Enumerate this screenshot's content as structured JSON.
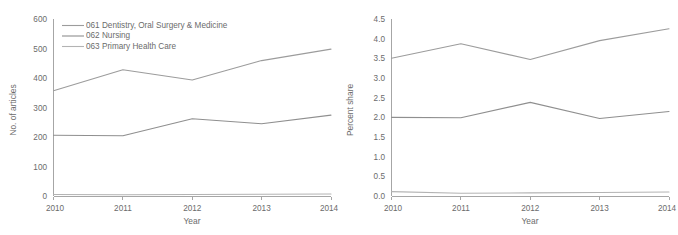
{
  "chart_data": [
    {
      "type": "line",
      "panel": "left",
      "title": "",
      "xlabel": "Year",
      "ylabel": "No. of articles",
      "x": [
        2010,
        2011,
        2012,
        2013,
        2014
      ],
      "categories": [
        "2010",
        "2011",
        "2012",
        "2013",
        "2014"
      ],
      "xticklabels": [
        "2010",
        "2011",
        "2012",
        "2013",
        "2014"
      ],
      "yticklabels": [
        "0",
        "100",
        "200",
        "300",
        "400",
        "500",
        "600"
      ],
      "yticks": [
        0,
        100,
        200,
        300,
        400,
        500,
        600
      ],
      "ylim": [
        0,
        600
      ],
      "grid": false,
      "legend_position": "top-left",
      "series": [
        {
          "name": "061 Dentistry, Oral Surgery & Medicine",
          "color": "#9c9c9c",
          "values": [
            357,
            428,
            393,
            459,
            498
          ]
        },
        {
          "name": "062 Nursing",
          "color": "#8f8f8f",
          "values": [
            206,
            204,
            262,
            245,
            274
          ]
        },
        {
          "name": "063 Primary Health Care",
          "color": "#b3b3b3",
          "values": [
            5,
            4,
            5,
            6,
            7
          ]
        }
      ]
    },
    {
      "type": "line",
      "panel": "right",
      "title": "",
      "xlabel": "Year",
      "ylabel": "Percent share",
      "x": [
        2010,
        2011,
        2012,
        2013,
        2014
      ],
      "categories": [
        "2010",
        "2011",
        "2012",
        "2013",
        "2014"
      ],
      "xticklabels": [
        "2010",
        "2011",
        "2012",
        "2013",
        "2014"
      ],
      "yticklabels": [
        "0.0",
        "0.5",
        "1.0",
        "1.5",
        "2.0",
        "2.5",
        "3.0",
        "3.5",
        "4.0",
        "4.5"
      ],
      "yticks": [
        0.0,
        0.5,
        1.0,
        1.5,
        2.0,
        2.5,
        3.0,
        3.5,
        4.0,
        4.5
      ],
      "ylim": [
        0.0,
        4.5
      ],
      "grid": false,
      "legend_position": "none",
      "series": [
        {
          "name": "061 Dentistry, Oral Surgery & Medicine",
          "color": "#9c9c9c",
          "values": [
            3.5,
            3.87,
            3.47,
            3.95,
            4.25
          ]
        },
        {
          "name": "062 Nursing",
          "color": "#8f8f8f",
          "values": [
            2.0,
            1.99,
            2.38,
            1.97,
            2.15
          ]
        },
        {
          "name": "063 Primary Health Care",
          "color": "#b3b3b3",
          "values": [
            0.11,
            0.07,
            0.08,
            0.09,
            0.1
          ]
        }
      ]
    }
  ],
  "left_panel": {
    "ylabel": "No. of articles",
    "xlabel": "Year",
    "yticks": [
      "600",
      "500",
      "400",
      "300",
      "200",
      "100",
      "0"
    ],
    "xticks": [
      "2010",
      "2011",
      "2012",
      "2013",
      "2014"
    ],
    "legend": [
      {
        "label": "061 Dentistry, Oral Surgery & Medicine"
      },
      {
        "label": "062 Nursing"
      },
      {
        "label": "063 Primary Health Care"
      }
    ]
  },
  "right_panel": {
    "ylabel": "Percent share",
    "xlabel": "Year",
    "yticks": [
      "4.5",
      "4.0",
      "3.5",
      "3.0",
      "2.5",
      "2.0",
      "1.5",
      "1.0",
      "0.5",
      "0.0"
    ],
    "xticks": [
      "2010",
      "2011",
      "2012",
      "2013",
      "2014"
    ]
  },
  "colors": {
    "series_061": "#9c9c9c",
    "series_062": "#8f8f8f",
    "series_063": "#b3b3b3",
    "axis": "#a6a6a6",
    "text": "#6b6b6b",
    "background": "#ffffff"
  }
}
